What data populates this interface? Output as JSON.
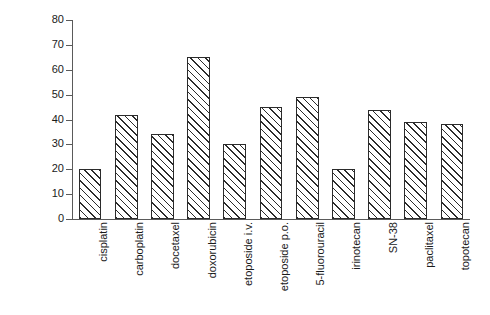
{
  "chart_data": {
    "type": "bar",
    "title": "",
    "xlabel": "",
    "ylabel": "% C.V. in clearance",
    "ylim": [
      0,
      80
    ],
    "yticks": [
      0,
      10,
      20,
      30,
      40,
      50,
      60,
      70,
      80
    ],
    "grid": false,
    "legend": null,
    "categories": [
      "cisplatin",
      "carboplatin",
      "docetaxel",
      "doxorubicin",
      "etoposide i.v.",
      "etoposide p.o.",
      "5-fluorouracil",
      "irinotecan",
      "SN-38",
      "paclitaxel",
      "topotecan"
    ],
    "values": [
      20,
      42,
      34,
      65,
      30,
      45,
      49,
      20,
      44,
      39,
      38
    ],
    "bar_style": {
      "fill": "#ffffff",
      "edge": "#2b2b2b",
      "hatch": "diagonal-45"
    }
  }
}
